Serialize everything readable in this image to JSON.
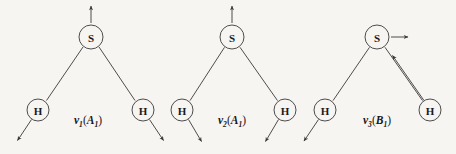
{
  "figure": {
    "background_color": "#f6f5f2",
    "stroke_color": "#3a3a3a",
    "text_color": "#16161a",
    "diagrams": [
      {
        "id": "mode-1",
        "label": {
          "symbol": "ν",
          "symbol_subscript": "1",
          "open_paren": "(",
          "term": "A",
          "term_subscript": "1",
          "close_paren": ")",
          "full_text": "ν1(A1)"
        },
        "atoms": [
          {
            "name": "sulfur-atom",
            "element": "S",
            "x": 91,
            "y": 37,
            "r": 12
          },
          {
            "name": "hydrogen-atom-left",
            "element": "H",
            "x": 38,
            "y": 110,
            "r": 11
          },
          {
            "name": "hydrogen-atom-right",
            "element": "H",
            "x": 143,
            "y": 110,
            "r": 11
          }
        ],
        "bonds": [
          {
            "name": "bond-s-h-left",
            "from": "S",
            "to": "H-left"
          },
          {
            "name": "bond-s-h-right",
            "from": "S",
            "to": "H-right"
          }
        ],
        "displacement_vectors": [
          {
            "name": "arrow-sulfur",
            "atom": "S",
            "direction": "up",
            "style": "single"
          },
          {
            "name": "arrow-hydrogen-left",
            "atom": "H-left",
            "direction": "down-left",
            "style": "single"
          },
          {
            "name": "arrow-hydrogen-right",
            "atom": "H-right",
            "direction": "down-right",
            "style": "single"
          }
        ]
      },
      {
        "id": "mode-2",
        "label": {
          "symbol": "ν",
          "symbol_subscript": "2",
          "open_paren": "(",
          "term": "A",
          "term_subscript": "1",
          "close_paren": ")",
          "full_text": "ν2(A1)"
        },
        "atoms": [
          {
            "name": "sulfur-atom",
            "element": "S",
            "x": 232,
            "y": 37,
            "r": 12
          },
          {
            "name": "hydrogen-atom-left",
            "element": "H",
            "x": 182,
            "y": 110,
            "r": 11
          },
          {
            "name": "hydrogen-atom-right",
            "element": "H",
            "x": 285,
            "y": 110,
            "r": 11
          }
        ],
        "bonds": [
          {
            "name": "bond-s-h-left",
            "from": "S",
            "to": "H-left"
          },
          {
            "name": "bond-s-h-right",
            "from": "S",
            "to": "H-right"
          }
        ],
        "displacement_vectors": [
          {
            "name": "arrow-sulfur",
            "atom": "S",
            "direction": "up",
            "style": "single"
          },
          {
            "name": "arrow-hydrogen-left",
            "atom": "H-left",
            "direction": "down-right",
            "style": "single"
          },
          {
            "name": "arrow-hydrogen-right",
            "atom": "H-right",
            "direction": "down-left",
            "style": "single"
          }
        ]
      },
      {
        "id": "mode-3",
        "label": {
          "symbol": "ν",
          "symbol_subscript": "3",
          "open_paren": "(",
          "term": "B",
          "term_subscript": "1",
          "close_paren": ")",
          "full_text": "ν3(B1)"
        },
        "atoms": [
          {
            "name": "sulfur-atom",
            "element": "S",
            "x": 377,
            "y": 37,
            "r": 12
          },
          {
            "name": "hydrogen-atom-left",
            "element": "H",
            "x": 325,
            "y": 110,
            "r": 11
          },
          {
            "name": "hydrogen-atom-right",
            "element": "H",
            "x": 430,
            "y": 110,
            "r": 11
          }
        ],
        "bonds": [
          {
            "name": "bond-s-h-left",
            "from": "S",
            "to": "H-left"
          },
          {
            "name": "bond-s-h-right",
            "from": "S",
            "to": "H-right"
          }
        ],
        "displacement_vectors": [
          {
            "name": "arrow-sulfur",
            "atom": "S",
            "direction": "right",
            "style": "single"
          },
          {
            "name": "arrow-hydrogen-left",
            "atom": "H-left",
            "direction": "down-left",
            "style": "single"
          },
          {
            "name": "arrow-hydrogen-right",
            "atom": "H-right",
            "direction": "up-left",
            "style": "long-double"
          }
        ]
      }
    ]
  }
}
